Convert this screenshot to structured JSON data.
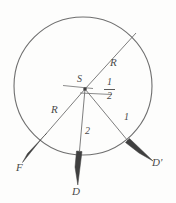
{
  "figure": {
    "type": "geometry-diagram",
    "background_color": "#fdfdfc",
    "stroke_color": "#6b6b6b",
    "arrow_fill_color": "#3f3f3f",
    "text_color": "#4a4a4a",
    "circle": {
      "center_label": "S",
      "cx": 83,
      "cy": 86,
      "r": 69
    },
    "labels": {
      "center": "S",
      "radius_upper_right": "R",
      "radius_lower_left": "R",
      "half_numerator": "1",
      "half_denominator": "2",
      "distance_two": "2",
      "distance_one": "1",
      "vector_f": "F",
      "vector_d": "D",
      "vector_d_prime": "D'"
    },
    "segments": [
      {
        "name": "radius-upper-right",
        "label": "R",
        "from": [
          85,
          89
        ],
        "to": [
          136,
          33
        ]
      },
      {
        "name": "radius-lower-left",
        "label": "R",
        "from": [
          85,
          89
        ],
        "to": [
          34,
          147
        ]
      },
      {
        "name": "segment-two",
        "label": "2",
        "from": [
          85,
          89
        ],
        "to": [
          78,
          164
        ]
      },
      {
        "name": "segment-one",
        "label": "1",
        "from": [
          85,
          89
        ],
        "to": [
          137,
          152
        ]
      },
      {
        "name": "tick-left",
        "label": "",
        "from": [
          63,
          85
        ],
        "to": [
          92,
          89
        ]
      },
      {
        "name": "tick-right",
        "label": "",
        "from": [
          80,
          93
        ],
        "to": [
          112,
          95
        ]
      }
    ],
    "vectors": [
      {
        "name": "vector-f",
        "label": "F",
        "tail": [
          44,
          136
        ],
        "tip": [
          23,
          161
        ]
      },
      {
        "name": "vector-d",
        "label": "D",
        "tail": [
          79,
          152
        ],
        "tip": [
          76,
          184
        ]
      },
      {
        "name": "vector-d-prime",
        "label": "D'",
        "tail": [
          127,
          141
        ],
        "tip": [
          152,
          160
        ]
      }
    ]
  }
}
